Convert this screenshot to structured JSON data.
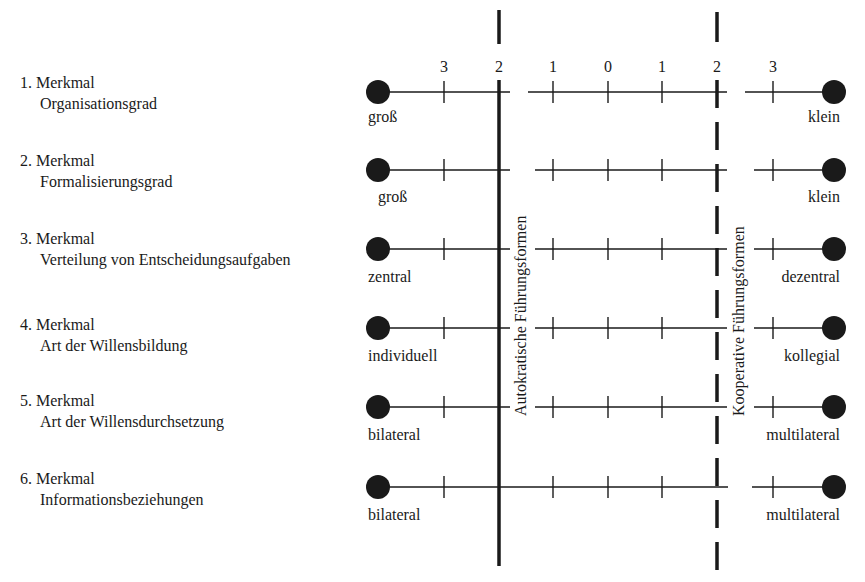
{
  "scale": {
    "tick_labels": [
      "3",
      "2",
      "1",
      "0",
      "1",
      "2",
      "3"
    ],
    "tick_x": [
      444,
      499,
      553,
      608,
      662,
      717,
      773
    ]
  },
  "zones": {
    "autocratic": {
      "label": "Autokratische Führungsformen",
      "line_style": "solid",
      "x": 499
    },
    "cooperative": {
      "label": "Kooperative Führungsformen",
      "line_style": "dashed",
      "x": 717
    }
  },
  "features": [
    {
      "number": "1. Merkmal",
      "name": "Organisationsgrad",
      "left_pole": "groß",
      "right_pole": "klein",
      "y": 92
    },
    {
      "number": "2. Merkmal",
      "name": "Formalisierungsgrad",
      "left_pole": "groß",
      "right_pole": "klein",
      "y": 170
    },
    {
      "number": "3. Merkmal",
      "name": "Verteilung von Entscheidungsaufgaben",
      "left_pole": "zentral",
      "right_pole": "dezentral",
      "y": 249
    },
    {
      "number": "4. Merkmal",
      "name": "Art der Willensbildung",
      "left_pole": "individuell",
      "right_pole": "kollegial",
      "y": 328
    },
    {
      "number": "5. Merkmal",
      "name": "Art der Willensdurchsetzung",
      "left_pole": "bilateral",
      "right_pole": "multilateral",
      "y": 407
    },
    {
      "number": "6. Merkmal",
      "name": "Informationsbeziehungen",
      "left_pole": "bilateral",
      "right_pole": "multilateral",
      "y": 487
    }
  ],
  "colors": {
    "ink": "#1a1a1a",
    "background": "#ffffff"
  }
}
